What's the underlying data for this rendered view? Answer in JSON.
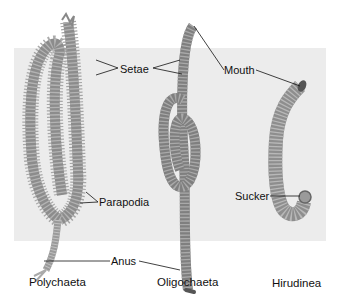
{
  "figure": {
    "background_panel_color": "#ececec",
    "worm_color": "#8a8a8a",
    "labels": {
      "setae": "Setae",
      "mouth": "Mouth",
      "parapodia": "Parapodia",
      "anus": "Anus",
      "sucker": "Sucker"
    },
    "captions": [
      {
        "label": "Polychaeta"
      },
      {
        "label": "Oligochaeta"
      },
      {
        "label": "Hirudinea"
      }
    ]
  }
}
